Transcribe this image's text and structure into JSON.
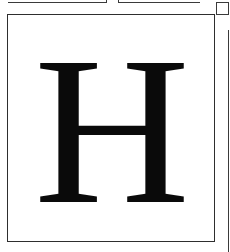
{
  "glyph_card": {
    "character": "H",
    "font_style": "serif",
    "text_color": "#0a0a0a",
    "border_color": "#2e2e2e"
  },
  "decorations": {
    "top_left_rule": true,
    "top_right_rule": true,
    "corner_square": true,
    "right_partial_rule": true
  }
}
